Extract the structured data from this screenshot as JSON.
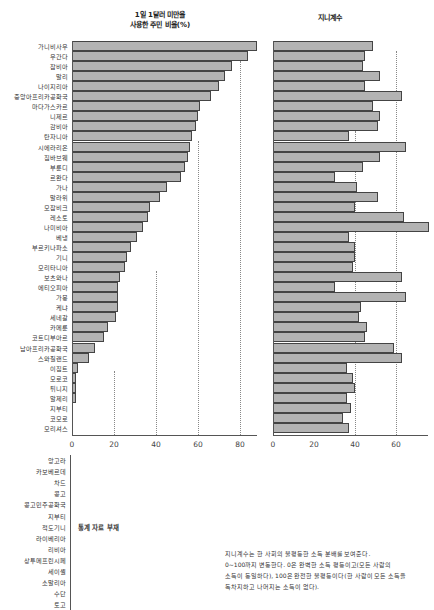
{
  "header": {
    "left_title_line1": "1일 1달러 미만을",
    "left_title_line2": "사용한 주민 비율(%)",
    "right_title": "지니계수"
  },
  "chart_data": [
    {
      "type": "bar",
      "orientation": "horizontal",
      "title": "1일 1달러 미만을 사용한 주민 비율(%)",
      "xlabel": "",
      "ylabel": "",
      "xlim": [
        0,
        90
      ],
      "xticks": [
        0,
        20,
        40,
        60,
        80
      ],
      "grid": "dotted vertical at 20, 40, 60, 80",
      "categories": [
        "가니비사우",
        "우간다",
        "잠비아",
        "말리",
        "나이지리아",
        "중앙아프리카공화국",
        "마다가스카르",
        "니제르",
        "감비아",
        "탄자니아",
        "시에라리온",
        "짐바브웨",
        "부룬디",
        "르완다",
        "가나",
        "말라위",
        "모잠비크",
        "레소토",
        "나미비아",
        "베냉",
        "부르키나파소",
        "기니",
        "모리타니아",
        "보츠와나",
        "에티오피아",
        "가봉",
        "케냐",
        "세네갈",
        "카메룬",
        "코트디부아르",
        "남아프리카공화국",
        "스와질랜드",
        "이집트",
        "모로코",
        "튀니지",
        "알제리",
        "지부티",
        "코모로",
        "모리셔스"
      ],
      "values": [
        88,
        84,
        76,
        73,
        70,
        66,
        61,
        60,
        59,
        57,
        56,
        55,
        54,
        52,
        45,
        42,
        37,
        36,
        34,
        31,
        28,
        26,
        25,
        23,
        22,
        22,
        22,
        21,
        17,
        15,
        11,
        8,
        3,
        2,
        2,
        2,
        0,
        0,
        0
      ]
    },
    {
      "type": "bar",
      "orientation": "horizontal",
      "title": "지니계수",
      "xlabel": "",
      "ylabel": "",
      "xlim": [
        0,
        76
      ],
      "xticks": [
        0,
        20,
        40,
        60
      ],
      "grid": "dotted vertical at 40, 60",
      "categories": [
        "가니비사우",
        "우간다",
        "잠비아",
        "말리",
        "나이지리아",
        "중앙아프리카공화국",
        "마다가스카르",
        "니제르",
        "감비아",
        "탄자니아",
        "시에라리온",
        "짐바브웨",
        "부룬디",
        "르완다",
        "가나",
        "말라위",
        "모잠비크",
        "레소토",
        "나미비아",
        "베냉",
        "부르키나파소",
        "기니",
        "모리타니아",
        "보츠와나",
        "에티오피아",
        "가봉",
        "케냐",
        "세네갈",
        "카메룬",
        "코트디부아르",
        "남아프리카공화국",
        "스와질랜드",
        "이집트",
        "모로코",
        "튀니지",
        "알제리",
        "지부티",
        "코모로",
        "모리셔스"
      ],
      "values": [
        49,
        45,
        44,
        52,
        45,
        63,
        49,
        52,
        51,
        37,
        65,
        52,
        44,
        30,
        41,
        51,
        40,
        64,
        76,
        37,
        40,
        40,
        39,
        63,
        30,
        65,
        43,
        42,
        46,
        45,
        59,
        63,
        36,
        39,
        40,
        36,
        38,
        34,
        37
      ]
    }
  ],
  "left_ticks": [
    "0",
    "20",
    "40",
    "60",
    "80"
  ],
  "right_ticks": [
    "0",
    "20",
    "40",
    "60"
  ],
  "no_data": {
    "label": "통계 자료 부재",
    "countries": [
      "앙고라",
      "카보베르데",
      "차드",
      "콩고",
      "콩고민주공화국",
      "지부티",
      "적도기니",
      "라이베리아",
      "리비아",
      "상투메프린시페",
      "세이셸",
      "소말리아",
      "수단",
      "토고"
    ]
  },
  "note": {
    "line1": "지니계수는 한 사회의 불평등한 소득 분배를 보여준다.",
    "line2": "0~100까지 변동한다. 0은 완벽한 소득 평등이고(모든 사람의",
    "line3": "소득이 동일하다), 100은 완전한 불평등이다(한 사람이 모든 소득을",
    "line4": "독차지하고 나머지는 소득이 없다)."
  }
}
